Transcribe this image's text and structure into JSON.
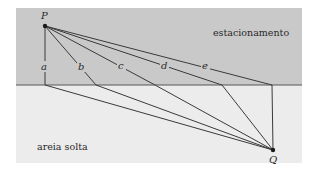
{
  "diagram": {
    "regions": {
      "parking": {
        "label": "estacionamento",
        "color": "#c9c9c9"
      },
      "sand": {
        "label": "areia solta",
        "color": "#ececec"
      }
    },
    "points": {
      "start": {
        "label": "P"
      },
      "end": {
        "label": "Q"
      }
    },
    "paths": [
      {
        "label": "a"
      },
      {
        "label": "b"
      },
      {
        "label": "c"
      },
      {
        "label": "d"
      },
      {
        "label": "e"
      }
    ],
    "line_color": "#3a3a3a"
  }
}
